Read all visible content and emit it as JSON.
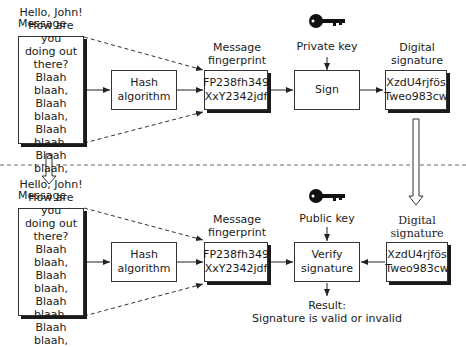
{
  "divider": {
    "style": "dashed",
    "color": "#666666"
  },
  "top": {
    "message_label": "Message",
    "message_lines": [
      "Hello, John!",
      "How are you",
      "doing out",
      "there?",
      "Blaah blaah,",
      "Blaah blaah,",
      "Blaah blaah,",
      "Blaah blaah,"
    ],
    "hash_box": [
      "Hash",
      "algorithm"
    ],
    "fingerprint_label": [
      "Message",
      "fingerprint"
    ],
    "fingerprint_box": [
      "FP238fh349",
      "XxY2342jdf"
    ],
    "key_label": "Private key",
    "sign_box": "Sign",
    "signature_label": [
      "Digital",
      "signature"
    ],
    "signature_box": [
      "XzdU4rjfös",
      "Tweo983cw"
    ]
  },
  "bottom": {
    "message_label": "Message",
    "message_lines": [
      "Hello, John!",
      "How are you",
      "doing out",
      "there?",
      "Blaah blaah,",
      "Blaah blaah,",
      "Blaah blaah,",
      "Blaah blaah,"
    ],
    "hash_box": [
      "Hash",
      "algorithm"
    ],
    "fingerprint_label": [
      "Message",
      "fingerprint"
    ],
    "fingerprint_box": [
      "FP238fh349",
      "XxY2342jdf"
    ],
    "key_label": "Public key",
    "verify_box": [
      "Verify",
      "signature"
    ],
    "signature_label": [
      "Digital",
      "signature"
    ],
    "signature_box": [
      "XzdU4rjfös",
      "Tweo983cw"
    ],
    "result": [
      "Result:",
      "Signature is valid or invalid"
    ]
  }
}
